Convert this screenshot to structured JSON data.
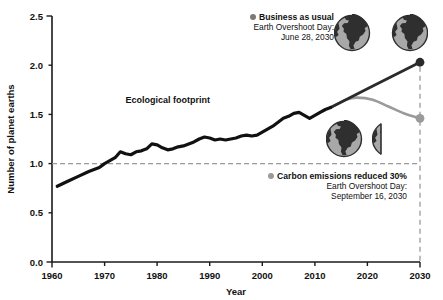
{
  "chart_data": {
    "type": "line",
    "title": "",
    "xlabel": "Year",
    "ylabel": "Number of planet earths",
    "xlim": [
      1960,
      2030
    ],
    "ylim": [
      0.0,
      2.5
    ],
    "xticks": [
      "1960",
      "1970",
      "1980",
      "1990",
      "2000",
      "2010",
      "2020",
      "2030"
    ],
    "yticks": [
      "0.0",
      "0.5",
      "1.0",
      "1.5",
      "2.0",
      "2.5"
    ],
    "grid": false,
    "legend_position": "inside-right",
    "reference_lines": [
      {
        "name": "one-earth-capacity",
        "axis": "y",
        "value": 1.0,
        "style": "dashed",
        "color": "#9a9a9a"
      },
      {
        "name": "projection-end-year",
        "axis": "x",
        "value": 2030,
        "style": "dashed",
        "color": "#9a9a9a"
      }
    ],
    "annotations": [
      {
        "name": "ecological-footprint-label",
        "text": "Ecological footprint",
        "x": 1982,
        "y": 1.62
      }
    ],
    "series": [
      {
        "name": "Ecological footprint",
        "color": "#111111",
        "kind": "historical",
        "x": [
          1961,
          1963,
          1965,
          1967,
          1969,
          1970,
          1971,
          1972,
          1973,
          1974,
          1975,
          1976,
          1977,
          1978,
          1979,
          1980,
          1981,
          1982,
          1983,
          1984,
          1985,
          1986,
          1987,
          1988,
          1989,
          1990,
          1991,
          1992,
          1993,
          1994,
          1995,
          1996,
          1997,
          1998,
          1999,
          2000,
          2001,
          2002,
          2003,
          2004,
          2005,
          2006,
          2007,
          2008,
          2009,
          2010,
          2011,
          2012,
          2013
        ],
        "y": [
          0.77,
          0.82,
          0.87,
          0.92,
          0.96,
          1.0,
          1.03,
          1.06,
          1.12,
          1.1,
          1.09,
          1.12,
          1.13,
          1.15,
          1.2,
          1.19,
          1.16,
          1.14,
          1.15,
          1.17,
          1.18,
          1.2,
          1.22,
          1.25,
          1.27,
          1.26,
          1.24,
          1.25,
          1.24,
          1.25,
          1.26,
          1.28,
          1.29,
          1.28,
          1.29,
          1.32,
          1.35,
          1.38,
          1.42,
          1.46,
          1.48,
          1.51,
          1.52,
          1.49,
          1.46,
          1.49,
          1.52,
          1.55,
          1.57
        ]
      },
      {
        "name": "Business as usual",
        "color": "#2a2a2a",
        "kind": "projection",
        "x": [
          2013,
          2020,
          2030
        ],
        "y": [
          1.57,
          1.76,
          2.03
        ],
        "endpoint": {
          "x": 2030,
          "y": 2.03
        }
      },
      {
        "name": "Carbon emissions reduced 30%",
        "color": "#9a9a9a",
        "kind": "projection",
        "x": [
          2013,
          2016,
          2018,
          2021,
          2024,
          2027,
          2030
        ],
        "y": [
          1.57,
          1.65,
          1.67,
          1.65,
          1.58,
          1.51,
          1.46
        ],
        "endpoint": {
          "x": 2030,
          "y": 1.46
        }
      }
    ]
  },
  "legend": {
    "business_as_usual": {
      "marker_color": "#7a7a7a",
      "label": "Business as usual",
      "line1": "Earth Overshoot Day:",
      "line2": "June 28, 2030"
    },
    "carbon_reduced": {
      "marker_color": "#9a9a9a",
      "label": "Carbon emissions reduced 30%",
      "line1": "Earth Overshoot Day:",
      "line2": "September 16, 2030"
    }
  },
  "globes": {
    "top_group_count": "2",
    "top_group_label": "two-earths-required",
    "bottom_group_count": "1.5",
    "bottom_group_label": "one-and-a-half-earths-required",
    "land_color": "#2f2f2f",
    "ocean_color": "#a8a8a8"
  },
  "axes": {
    "ylabel": "Number of planet earths",
    "xlabel": "Year",
    "yticks": [
      "2.5",
      "2.0",
      "1.5",
      "1.0",
      "0.5",
      "0.0"
    ],
    "xticks": [
      "1960",
      "1970",
      "1980",
      "1990",
      "2000",
      "2010",
      "2020",
      "2030"
    ]
  },
  "annotations": {
    "ecological_footprint": "Ecological footprint"
  }
}
